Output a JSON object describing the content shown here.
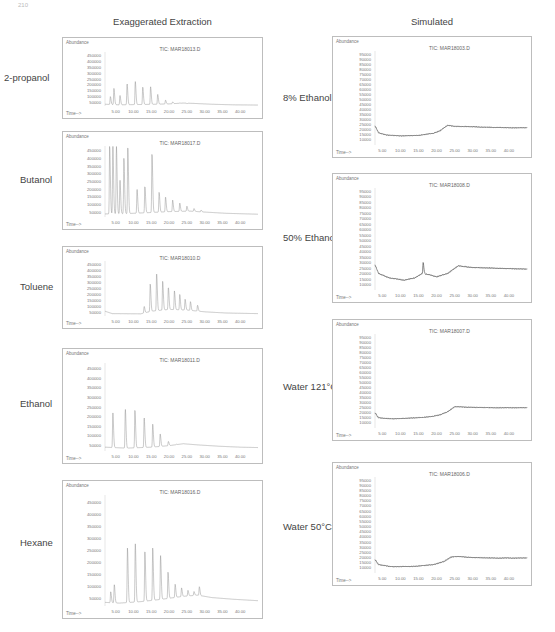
{
  "page": {
    "number": "210"
  },
  "columns": [
    {
      "title": "Exaggerated Extraction"
    },
    {
      "title": "Simulated"
    }
  ],
  "chart_data": [
    {
      "id": "2-propanol",
      "type": "line",
      "column": "Exaggerated Extraction",
      "row_label": "2-propanol",
      "title": "TIC: MAR18013.D",
      "xlabel": "Time-->",
      "ylabel": "Abundance",
      "xticks": [
        "5.00",
        "10.00",
        "15.00",
        "20.00",
        "25.00",
        "30.00",
        "35.00",
        "40.00"
      ],
      "yticks": [
        "50000",
        "100000",
        "150000",
        "200000",
        "250000",
        "300000",
        "350000",
        "400000",
        "450000"
      ],
      "xlim": [
        2,
        45
      ],
      "ylim": [
        20000,
        480000
      ],
      "peaks": [
        [
          3.5,
          100000
        ],
        [
          4.5,
          170000
        ],
        [
          6.2,
          110000
        ],
        [
          8.2,
          210000
        ],
        [
          10.5,
          230000
        ],
        [
          12.6,
          180000
        ],
        [
          14.8,
          185000
        ],
        [
          16.8,
          120000
        ],
        [
          19,
          70000
        ],
        [
          21,
          55000
        ],
        [
          23,
          45000
        ],
        [
          25,
          40000
        ]
      ],
      "baseline": [
        [
          2,
          35000
        ],
        [
          6,
          30000
        ],
        [
          10,
          32000
        ],
        [
          15,
          34000
        ],
        [
          20,
          38000
        ],
        [
          24,
          45000
        ],
        [
          27,
          42000
        ],
        [
          32,
          35000
        ],
        [
          38,
          30000
        ],
        [
          45,
          28000
        ]
      ]
    },
    {
      "id": "butanol",
      "type": "line",
      "column": "Exaggerated Extraction",
      "row_label": "Butanol",
      "title": "TIC: MAR18017.D",
      "xlabel": "Time-->",
      "ylabel": "Abundance",
      "xticks": [
        "5.00",
        "10.00",
        "15.00",
        "20.00",
        "25.00",
        "30.00",
        "35.00",
        "40.00"
      ],
      "yticks": [
        "50000",
        "100000",
        "150000",
        "200000",
        "250000",
        "300000",
        "350000",
        "400000",
        "450000"
      ],
      "xlim": [
        2,
        45
      ],
      "ylim": [
        20000,
        480000
      ],
      "peaks": [
        [
          3.3,
          480000
        ],
        [
          4.2,
          480000
        ],
        [
          5.2,
          480000
        ],
        [
          6.2,
          260000
        ],
        [
          7.3,
          400000
        ],
        [
          8.4,
          480000
        ],
        [
          11,
          200000
        ],
        [
          13.2,
          220000
        ],
        [
          15.2,
          430000
        ],
        [
          17.2,
          180000
        ],
        [
          19,
          150000
        ],
        [
          21,
          130000
        ],
        [
          23,
          110000
        ],
        [
          25,
          90000
        ],
        [
          27,
          75000
        ],
        [
          29,
          65000
        ]
      ],
      "baseline": [
        [
          2,
          40000
        ],
        [
          8,
          42000
        ],
        [
          14,
          48000
        ],
        [
          20,
          55000
        ],
        [
          26,
          58000
        ],
        [
          30,
          52000
        ],
        [
          36,
          44000
        ],
        [
          45,
          38000
        ]
      ]
    },
    {
      "id": "toluene",
      "type": "line",
      "column": "Exaggerated Extraction",
      "row_label": "Toluene",
      "title": "TIC: MAR18010.D",
      "xlabel": "Time-->",
      "ylabel": "Abundance",
      "xticks": [
        "5.00",
        "10.00",
        "15.00",
        "20.00",
        "25.00",
        "30.00",
        "35.00",
        "40.00"
      ],
      "yticks": [
        "50000",
        "100000",
        "150000",
        "200000",
        "250000",
        "300000",
        "350000",
        "400000",
        "450000"
      ],
      "xlim": [
        2,
        45
      ],
      "ylim": [
        20000,
        480000
      ],
      "peaks": [
        [
          13,
          100000
        ],
        [
          14.7,
          290000
        ],
        [
          16.5,
          380000
        ],
        [
          18.2,
          310000
        ],
        [
          19.8,
          260000
        ],
        [
          21.5,
          230000
        ],
        [
          23,
          200000
        ],
        [
          24.5,
          160000
        ],
        [
          26,
          140000
        ],
        [
          28,
          110000
        ]
      ],
      "baseline": [
        [
          2,
          60000
        ],
        [
          4,
          40000
        ],
        [
          12,
          38000
        ],
        [
          15,
          60000
        ],
        [
          20,
          75000
        ],
        [
          25,
          70000
        ],
        [
          30,
          55000
        ],
        [
          36,
          45000
        ],
        [
          45,
          40000
        ]
      ]
    },
    {
      "id": "ethanol",
      "type": "line",
      "column": "Exaggerated Extraction",
      "row_label": "Ethanol",
      "title": "TIC: MAR18011.D",
      "xlabel": "Time-->",
      "ylabel": "Abundance",
      "xticks": [
        "5.00",
        "10.00",
        "15.00",
        "20.00",
        "25.00",
        "30.00",
        "35.00",
        "40.00"
      ],
      "yticks": [
        "50000",
        "100000",
        "150000",
        "200000",
        "250000",
        "300000",
        "350000",
        "400000",
        "450000"
      ],
      "xlim": [
        2,
        45
      ],
      "ylim": [
        20000,
        480000
      ],
      "peaks": [
        [
          4.2,
          220000
        ],
        [
          7.7,
          240000
        ],
        [
          10.4,
          235000
        ],
        [
          13,
          195000
        ],
        [
          15.4,
          160000
        ],
        [
          17.5,
          110000
        ],
        [
          19.8,
          70000
        ],
        [
          22,
          55000
        ]
      ],
      "baseline": [
        [
          2,
          40000
        ],
        [
          8,
          35000
        ],
        [
          15,
          40000
        ],
        [
          20,
          48000
        ],
        [
          24,
          58000
        ],
        [
          28,
          52000
        ],
        [
          34,
          45000
        ],
        [
          40,
          40000
        ],
        [
          45,
          38000
        ]
      ]
    },
    {
      "id": "hexane",
      "type": "line",
      "column": "Exaggerated Extraction",
      "row_label": "Hexane",
      "title": "TIC: MAR18016.D",
      "xlabel": "Time-->",
      "ylabel": "Abundance",
      "xticks": [
        "5.00",
        "10.00",
        "15.00",
        "20.00",
        "25.00",
        "30.00",
        "35.00",
        "40.00"
      ],
      "yticks": [
        "50000",
        "100000",
        "150000",
        "200000",
        "250000",
        "300000",
        "350000",
        "400000",
        "450000"
      ],
      "xlim": [
        2,
        45
      ],
      "ylim": [
        20000,
        480000
      ],
      "peaks": [
        [
          3.6,
          80000
        ],
        [
          4.6,
          110000
        ],
        [
          8.3,
          260000
        ],
        [
          10.5,
          280000
        ],
        [
          13.2,
          250000
        ],
        [
          15.4,
          260000
        ],
        [
          17.6,
          230000
        ],
        [
          19.7,
          160000
        ],
        [
          21.7,
          110000
        ],
        [
          23.5,
          95000
        ],
        [
          25.3,
          85000
        ],
        [
          27,
          80000
        ],
        [
          28.5,
          100000
        ]
      ],
      "baseline": [
        [
          2,
          35000
        ],
        [
          6,
          32000
        ],
        [
          12,
          38000
        ],
        [
          18,
          48000
        ],
        [
          24,
          60000
        ],
        [
          28,
          65000
        ],
        [
          32,
          55000
        ],
        [
          38,
          48000
        ],
        [
          45,
          42000
        ]
      ]
    },
    {
      "id": "8-ethanol",
      "type": "line",
      "column": "Simulated",
      "row_label": "8% Ethanol",
      "title": "TIC: MAR18003.D",
      "xlabel": "Time-->",
      "ylabel": "Abundance",
      "xticks": [
        "5.00",
        "10.00",
        "15.00",
        "20.00",
        "25.00",
        "30.00",
        "35.00",
        "40.00"
      ],
      "yticks": [
        "10000",
        "15000",
        "20000",
        "25000",
        "30000",
        "35000",
        "40000",
        "45000",
        "50000",
        "55000",
        "60000",
        "65000",
        "70000",
        "75000",
        "80000",
        "85000",
        "90000",
        "95000"
      ],
      "xlim": [
        3,
        45
      ],
      "ylim": [
        5000,
        98000
      ],
      "peaks": [],
      "baseline": [
        [
          3,
          24000
        ],
        [
          4,
          17000
        ],
        [
          6,
          15000
        ],
        [
          10,
          14000
        ],
        [
          15,
          14500
        ],
        [
          19,
          16500
        ],
        [
          21,
          19000
        ],
        [
          23,
          24500
        ],
        [
          25,
          23500
        ],
        [
          30,
          23000
        ],
        [
          35,
          22500
        ],
        [
          40,
          22000
        ],
        [
          45,
          22000
        ]
      ]
    },
    {
      "id": "50-ethanol",
      "type": "line",
      "column": "Simulated",
      "row_label": "50% Ethanol",
      "title": "TIC: MAR18008.D",
      "xlabel": "Time-->",
      "ylabel": "Abundance",
      "xticks": [
        "5.00",
        "10.00",
        "15.00",
        "20.00",
        "25.00",
        "30.00",
        "35.00",
        "40.00"
      ],
      "yticks": [
        "10000",
        "15000",
        "20000",
        "25000",
        "30000",
        "35000",
        "40000",
        "45000",
        "50000",
        "55000",
        "60000",
        "65000",
        "70000",
        "75000",
        "80000",
        "85000",
        "90000",
        "95000"
      ],
      "xlim": [
        3,
        45
      ],
      "ylim": [
        5000,
        98000
      ],
      "peaks": [
        [
          16.3,
          30000
        ]
      ],
      "baseline": [
        [
          3,
          28000
        ],
        [
          4,
          20000
        ],
        [
          7,
          16000
        ],
        [
          11,
          14000
        ],
        [
          14,
          16000
        ],
        [
          16,
          20000
        ],
        [
          18,
          19000
        ],
        [
          20,
          17000
        ],
        [
          23,
          20000
        ],
        [
          26,
          27000
        ],
        [
          30,
          25500
        ],
        [
          35,
          25000
        ],
        [
          40,
          24500
        ],
        [
          45,
          24000
        ]
      ]
    },
    {
      "id": "water-121c",
      "type": "line",
      "column": "Simulated",
      "row_label": "Water 121°C",
      "title": "TIC: MAR18007.D",
      "xlabel": "Time-->",
      "ylabel": "Abundance",
      "xticks": [
        "5.00",
        "10.00",
        "15.00",
        "20.00",
        "25.00",
        "30.00",
        "35.00",
        "40.00"
      ],
      "yticks": [
        "10000",
        "15000",
        "20000",
        "25000",
        "30000",
        "35000",
        "40000",
        "45000",
        "50000",
        "55000",
        "60000",
        "65000",
        "70000",
        "75000",
        "80000",
        "85000",
        "90000",
        "95000"
      ],
      "xlim": [
        3,
        45
      ],
      "ylim": [
        5000,
        98000
      ],
      "peaks": [],
      "baseline": [
        [
          3,
          20000
        ],
        [
          4,
          15000
        ],
        [
          8,
          14000
        ],
        [
          14,
          15000
        ],
        [
          18,
          16000
        ],
        [
          21,
          18000
        ],
        [
          23,
          21000
        ],
        [
          25,
          26000
        ],
        [
          30,
          25500
        ],
        [
          35,
          25000
        ],
        [
          40,
          25000
        ],
        [
          45,
          25000
        ]
      ]
    },
    {
      "id": "water-50c",
      "type": "line",
      "column": "Simulated",
      "row_label": "Water 50°C",
      "title": "TIC: MAR18006.D",
      "xlabel": "Time-->",
      "ylabel": "Abundance",
      "xticks": [
        "5.00",
        "10.00",
        "15.00",
        "20.00",
        "25.00",
        "30.00",
        "35.00",
        "40.00"
      ],
      "yticks": [
        "10000",
        "15000",
        "20000",
        "25000",
        "30000",
        "35000",
        "40000",
        "45000",
        "50000",
        "55000",
        "60000",
        "65000",
        "70000",
        "75000",
        "80000",
        "85000",
        "90000",
        "95000"
      ],
      "xlim": [
        3,
        45
      ],
      "ylim": [
        5000,
        98000
      ],
      "peaks": [],
      "baseline": [
        [
          3,
          18000
        ],
        [
          4,
          13000
        ],
        [
          8,
          11000
        ],
        [
          14,
          11500
        ],
        [
          19,
          13000
        ],
        [
          22,
          16000
        ],
        [
          24,
          20500
        ],
        [
          26,
          21000
        ],
        [
          30,
          20000
        ],
        [
          35,
          19500
        ],
        [
          40,
          19500
        ],
        [
          45,
          19500
        ]
      ]
    }
  ],
  "layout": {
    "panels": [
      {
        "x": 62,
        "y": 37,
        "w": 201,
        "h": 82
      },
      {
        "x": 62,
        "y": 131,
        "w": 201,
        "h": 99
      },
      {
        "x": 62,
        "y": 246,
        "w": 201,
        "h": 83
      },
      {
        "x": 62,
        "y": 348,
        "w": 201,
        "h": 116
      },
      {
        "x": 62,
        "y": 480,
        "w": 201,
        "h": 139
      },
      {
        "x": 332,
        "y": 36,
        "w": 200,
        "h": 122
      },
      {
        "x": 332,
        "y": 173,
        "w": 200,
        "h": 130
      },
      {
        "x": 332,
        "y": 319,
        "w": 200,
        "h": 122
      },
      {
        "x": 332,
        "y": 462,
        "w": 200,
        "h": 124
      }
    ],
    "labels": [
      {
        "x": 4,
        "y": 72
      },
      {
        "x": 20,
        "y": 174
      },
      {
        "x": 20,
        "y": 281
      },
      {
        "x": 20,
        "y": 398
      },
      {
        "x": 20,
        "y": 537
      },
      {
        "x": 283,
        "y": 92
      },
      {
        "x": 283,
        "y": 232
      },
      {
        "x": 283,
        "y": 381
      },
      {
        "x": 283,
        "y": 521
      }
    ]
  }
}
